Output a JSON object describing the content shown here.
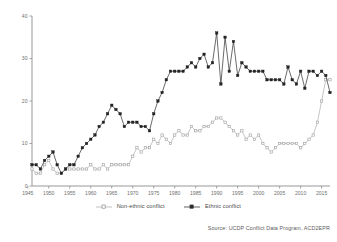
{
  "figure": {
    "title": "",
    "source_note": "Source: UCDP Conflict Data Program, ACD2EPR"
  },
  "legend": {
    "items": [
      {
        "label": "Non-ethnic conflict",
        "color": "#b3b3b3",
        "marker": "open-square"
      },
      {
        "label": "Ethnic conflict",
        "color": "#3a3a3a",
        "marker": "filled-square"
      }
    ]
  },
  "axes": {
    "y_ticks": [
      "0",
      "10",
      "20",
      "30",
      "40"
    ],
    "x_ticks": [
      "1945",
      "1950",
      "1955",
      "1960",
      "1965",
      "1970",
      "1975",
      "1980",
      "1985",
      "1990",
      "1995",
      "2000",
      "2005",
      "2010",
      "2015"
    ],
    "ylabel": "",
    "xlabel": ""
  },
  "chart_data": {
    "type": "line",
    "title": "",
    "xlabel": "",
    "ylabel": "",
    "xlim": [
      1946,
      2017
    ],
    "ylim": [
      0,
      40
    ],
    "grid": false,
    "legend_position": "bottom",
    "x": [
      1946,
      1947,
      1948,
      1949,
      1950,
      1951,
      1952,
      1953,
      1954,
      1955,
      1956,
      1957,
      1958,
      1959,
      1960,
      1961,
      1962,
      1963,
      1964,
      1965,
      1966,
      1967,
      1968,
      1969,
      1970,
      1971,
      1972,
      1973,
      1974,
      1975,
      1976,
      1977,
      1978,
      1979,
      1980,
      1981,
      1982,
      1983,
      1984,
      1985,
      1986,
      1987,
      1988,
      1989,
      1990,
      1991,
      1992,
      1993,
      1994,
      1995,
      1996,
      1997,
      1998,
      1999,
      2000,
      2001,
      2002,
      2003,
      2004,
      2005,
      2006,
      2007,
      2008,
      2009,
      2010,
      2011,
      2012,
      2013,
      2014,
      2015,
      2016,
      2017
    ],
    "series": [
      {
        "name": "Ethnic conflict",
        "color": "#3a3a3a",
        "marker": "filled-square",
        "values": [
          5,
          5,
          4,
          6,
          7,
          8,
          5,
          3,
          4,
          5,
          5,
          7,
          9,
          10,
          11,
          12,
          14,
          15,
          17,
          19,
          18,
          17,
          14,
          15,
          15,
          15,
          14,
          14,
          13,
          17,
          20,
          22,
          25,
          27,
          27,
          27,
          27,
          28,
          29,
          28,
          30,
          31,
          28,
          29,
          36,
          24,
          35,
          27,
          34,
          26,
          29,
          28,
          27,
          27,
          27,
          27,
          25,
          25,
          25,
          25,
          24,
          28,
          25,
          24,
          27,
          23,
          27,
          27,
          26,
          27,
          26,
          22
        ]
      },
      {
        "name": "Non-ethnic conflict",
        "color": "#b3b3b3",
        "marker": "open-square",
        "values": [
          4,
          3,
          3,
          5,
          6,
          4,
          3,
          3,
          4,
          4,
          4,
          4,
          4,
          4,
          5,
          4,
          4,
          5,
          4,
          5,
          5,
          5,
          5,
          5,
          7,
          9,
          8,
          9,
          9,
          11,
          10,
          12,
          11,
          10,
          12,
          13,
          12,
          12,
          14,
          13,
          13,
          14,
          14,
          15,
          16,
          16,
          15,
          14,
          13,
          12,
          13,
          11,
          12,
          11,
          12,
          10,
          9,
          8,
          9,
          10,
          10,
          10,
          10,
          10,
          9,
          10,
          11,
          12,
          15,
          20,
          25,
          25
        ]
      }
    ]
  }
}
